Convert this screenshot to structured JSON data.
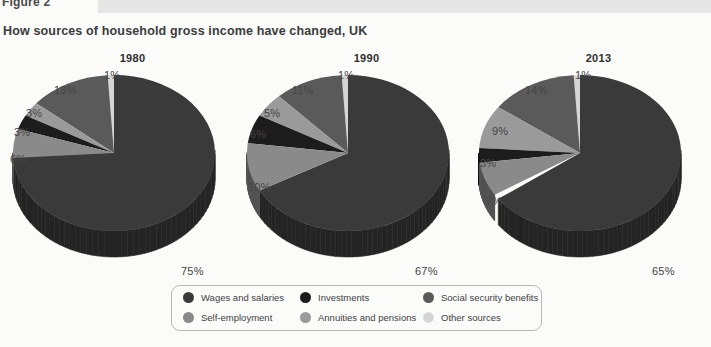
{
  "header": {
    "figure_label": "Figure 2",
    "title": "How sources of household gross income have changed, UK"
  },
  "colors": {
    "wages": "#3a3a3a",
    "self_employment": "#8a8a8a",
    "investments": "#1c1c1c",
    "annuities": "#9a9a9a",
    "social_security": "#5a5a5a",
    "other": "#d5d5d5",
    "legend_border": "#b9b9b9",
    "band": "#e6e6e6",
    "background": "#fbfbfa"
  },
  "legend": {
    "items": [
      {
        "label": "Wages and salaries",
        "color_key": "wages"
      },
      {
        "label": "Investments",
        "color_key": "investments"
      },
      {
        "label": "Social security benefits",
        "color_key": "social_security"
      },
      {
        "label": "Self-employment",
        "color_key": "self_employment"
      },
      {
        "label": "Annuities and pensions",
        "color_key": "annuities"
      },
      {
        "label": "Other sources",
        "color_key": "other"
      }
    ]
  },
  "chart_data": {
    "type": "pie",
    "title": "How sources of household gross income have changed, UK",
    "subtitle": "Figure 2",
    "value_unit": "percent",
    "legend_position": "bottom",
    "categories": [
      "Wages and salaries",
      "Self-employment",
      "Investments",
      "Annuities and pensions",
      "Social security benefits",
      "Other sources"
    ],
    "charts": [
      {
        "title": "1980",
        "slices": [
          {
            "label": "Wages and salaries",
            "value": 75,
            "display": "75%"
          },
          {
            "label": "Self-employment",
            "value": 6,
            "display": "6%"
          },
          {
            "label": "Investments",
            "value": 3,
            "display": "3%"
          },
          {
            "label": "Annuities and pensions",
            "value": 3,
            "display": "3%"
          },
          {
            "label": "Social security benefits",
            "value": 13,
            "display": "13%"
          },
          {
            "label": "Other sources",
            "value": 1,
            "display": "1%"
          }
        ]
      },
      {
        "title": "1990",
        "slices": [
          {
            "label": "Wages and salaries",
            "value": 67,
            "display": "67%"
          },
          {
            "label": "Self-employment",
            "value": 10,
            "display": "10%"
          },
          {
            "label": "Investments",
            "value": 6,
            "display": "6%"
          },
          {
            "label": "Annuities and pensions",
            "value": 5,
            "display": "5%"
          },
          {
            "label": "Social security benefits",
            "value": 11,
            "display": "11%"
          },
          {
            "label": "Other sources",
            "value": 1,
            "display": "1%"
          }
        ]
      },
      {
        "title": "2013",
        "slices": [
          {
            "label": "Wages and salaries",
            "value": 65,
            "display": "65%"
          },
          {
            "label": "Self-employment",
            "value": 7,
            "display": "7%"
          },
          {
            "label": "Investments",
            "value": 3,
            "display": "3%"
          },
          {
            "label": "Annuities and pensions",
            "value": 9,
            "display": "9%"
          },
          {
            "label": "Social security benefits",
            "value": 14,
            "display": "14%"
          },
          {
            "label": "Other sources",
            "value": 1,
            "display": "1%"
          }
        ]
      }
    ]
  }
}
